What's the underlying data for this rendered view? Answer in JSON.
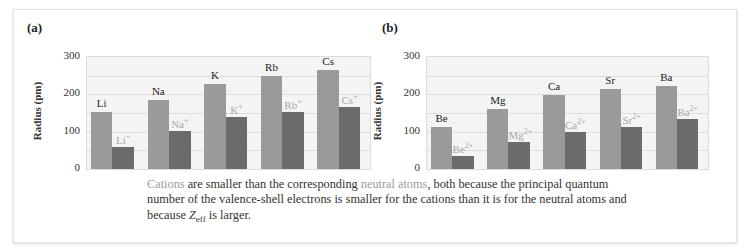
{
  "caption": {
    "highlight1": "Cations",
    "part1": " are smaller than the corresponding ",
    "highlight2": "neutral atoms",
    "part2": ", both because the principal quantum number of the valence-shell electrons is smaller for the cations than it is for the neutral atoms and because ",
    "z_symbol": "Z",
    "z_subscript": "eff",
    "part3": " is larger."
  },
  "colors": {
    "atom_bar": "#9a9a9a",
    "ion_bar": "#6b6b6b",
    "ion_label": "#a8a8a8",
    "highlight_text": "#9c9c9c"
  },
  "chart_data": [
    {
      "type": "bar",
      "panel": "(a)",
      "title": "",
      "xlabel": "",
      "ylabel": "Radius (pm)",
      "ylim": [
        0,
        300
      ],
      "yticks": [
        0,
        100,
        200,
        300
      ],
      "grid": true,
      "categories": [
        "Li",
        "Na",
        "K",
        "Rb",
        "Cs"
      ],
      "series": [
        {
          "name": "Neutral atom",
          "labels": [
            "Li",
            "Na",
            "K",
            "Rb",
            "Cs"
          ],
          "values": [
            152,
            186,
            227,
            248,
            265
          ]
        },
        {
          "name": "Cation",
          "labels": [
            "Li",
            "Na",
            "K",
            "Rb",
            "Cs"
          ],
          "charge": "+",
          "values": [
            60,
            102,
            138,
            152,
            167
          ]
        }
      ]
    },
    {
      "type": "bar",
      "panel": "(b)",
      "title": "",
      "xlabel": "",
      "ylabel": "Radius (pm)",
      "ylim": [
        0,
        300
      ],
      "yticks": [
        0,
        100,
        200,
        300
      ],
      "grid": true,
      "categories": [
        "Be",
        "Mg",
        "Ca",
        "Sr",
        "Ba"
      ],
      "series": [
        {
          "name": "Neutral atom",
          "labels": [
            "Be",
            "Mg",
            "Ca",
            "Sr",
            "Ba"
          ],
          "values": [
            112,
            160,
            197,
            215,
            222
          ]
        },
        {
          "name": "Cation",
          "labels": [
            "Be",
            "Mg",
            "Ca",
            "Sr",
            "Ba"
          ],
          "charge": "2+",
          "values": [
            34,
            72,
            100,
            112,
            134
          ]
        }
      ]
    }
  ]
}
